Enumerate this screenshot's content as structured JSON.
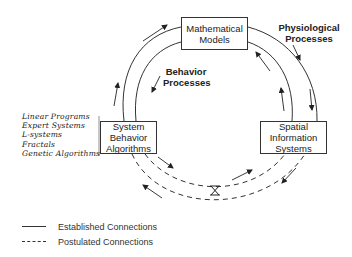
{
  "diagram": {
    "nodes": {
      "mathematical_models": {
        "line1": "Mathematical",
        "line2": "Models"
      },
      "system_behavior": {
        "line1": "System",
        "line2": "Behavior",
        "line3": "Algorithms"
      },
      "spatial_info": {
        "line1": "Spatial",
        "line2": "Information",
        "line3": "Systems"
      }
    },
    "process_labels": {
      "physiological": {
        "line1": "Physiological",
        "line2": "Processes"
      },
      "behavior": {
        "line1": "Behavior",
        "line2": "Processes"
      }
    },
    "algorithm_list": [
      "Linear Programs",
      "Expert Systems",
      "L-systems",
      "Fractals",
      "Genetic Algorithms"
    ],
    "edges": [
      {
        "from": "System Behavior Algorithms",
        "to": "Mathematical Models",
        "type": "established"
      },
      {
        "from": "Mathematical Models",
        "to": "System Behavior Algorithms",
        "type": "established"
      },
      {
        "from": "Mathematical Models",
        "to": "Spatial Information Systems",
        "type": "established"
      },
      {
        "from": "Spatial Information Systems",
        "to": "Mathematical Models",
        "type": "established"
      },
      {
        "from": "System Behavior Algorithms",
        "to": "Spatial Information Systems",
        "type": "postulated"
      },
      {
        "from": "Spatial Information Systems",
        "to": "System Behavior Algorithms",
        "type": "postulated"
      }
    ],
    "junction_icon": "hourglass-valve-icon"
  },
  "legend": {
    "established": "Established Connections",
    "postulated": "Postulated Connections"
  }
}
